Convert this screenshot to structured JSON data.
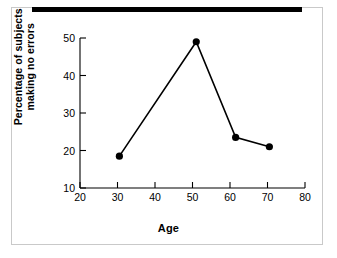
{
  "figure": {
    "background_color": "#ffffff",
    "frame_color": "#c9c9c9",
    "top_bar_color": "#000000",
    "line_color": "#000000"
  },
  "chart_data": {
    "type": "line",
    "title": "",
    "xlabel": "Age",
    "ylabel_line1": "Percentage of subjects",
    "ylabel_line2": "making no errors",
    "ylabel": "Percentage of subjects making no errors",
    "x": [
      30.5,
      51,
      61.5,
      70.5
    ],
    "values": [
      18.5,
      49,
      23.5,
      21
    ],
    "series": [
      {
        "name": "Percentage of subjects making no errors",
        "x": [
          30.5,
          51,
          61.5,
          70.5
        ],
        "values": [
          18.5,
          49,
          23.5,
          21
        ]
      }
    ],
    "xlim": [
      20,
      80
    ],
    "ylim": [
      10,
      50
    ],
    "xticks": [
      20,
      30,
      40,
      50,
      60,
      70,
      80
    ],
    "yticks": [
      10,
      20,
      30,
      40,
      50
    ],
    "xtick_labels": [
      "20",
      "30",
      "40",
      "50",
      "60",
      "70",
      "80"
    ],
    "ytick_labels": [
      "10",
      "20",
      "30",
      "40",
      "50"
    ],
    "grid": false,
    "legend": false,
    "marker": "filled-circle",
    "marker_color": "#000000",
    "line_color": "#000000"
  }
}
